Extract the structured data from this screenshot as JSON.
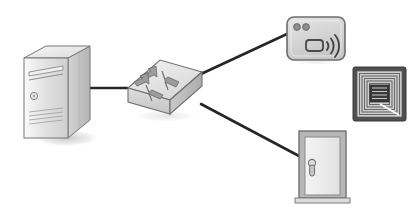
{
  "diagram": {
    "background_color": "#ffffff",
    "style": "grayscale isometric clip-art",
    "line_color": "#262626",
    "nodes": [
      {
        "id": "server",
        "label": "Server",
        "icon": "server-tower-icon",
        "type": "server",
        "x": 22,
        "y": 42,
        "width": 68,
        "height": 100,
        "details": [
          "optical-drive-slot",
          "power-button",
          "front-vents"
        ],
        "colors": {
          "front": "#d8d8d8",
          "side": "#c2c2c2",
          "top": "#ededed",
          "outline": "#7a7a7a"
        }
      },
      {
        "id": "switch",
        "label": "Network Switch",
        "icon": "network-switch-icon",
        "type": "switch",
        "x": 126,
        "y": 60,
        "width": 76,
        "height": 56,
        "details": [
          "four-directional-arrows"
        ],
        "colors": {
          "top": "#e4e4e4",
          "front": "#d0d0d0",
          "side": "#bdbdbd",
          "outline": "#6f6f6f",
          "arrow": "#9a9a9a"
        }
      },
      {
        "id": "card-reader",
        "label": "RFID Card Reader",
        "icon": "rfid-card-reader-icon",
        "type": "reader",
        "x": 286,
        "y": 16,
        "width": 60,
        "height": 46,
        "details": [
          "two-led-indicators",
          "contactless-wave-symbol",
          "card-glyph"
        ],
        "colors": {
          "body": "#d9d9d9",
          "outline": "#6d6d6d",
          "led": "#8d8d8d",
          "wave": "#4a4a4a"
        }
      },
      {
        "id": "rfid-tag",
        "label": "RFID Tag",
        "icon": "rfid-tag-antenna-icon",
        "type": "tag",
        "x": 352,
        "y": 66,
        "width": 54,
        "height": 56,
        "details": [
          "concentric-square-antenna-coil",
          "center-chip-module"
        ],
        "colors": {
          "border": "#4f4f4f",
          "field": "#cfcfcf",
          "trace": "#6b6b6b",
          "chip": "#3a3a3a"
        }
      },
      {
        "id": "door",
        "label": "Door",
        "icon": "door-icon",
        "type": "door",
        "x": 298,
        "y": 130,
        "width": 50,
        "height": 72,
        "details": [
          "door-frame",
          "lever-handle",
          "threshold"
        ],
        "colors": {
          "frame": "#9a9a9a",
          "panel": "#efefef",
          "handle": "#a8a8a8",
          "outline": "#707070"
        }
      }
    ],
    "links": [
      {
        "id": "link-server-switch",
        "label": "Server to switch link",
        "from": "server",
        "to": "switch",
        "x1": 90,
        "y1": 88,
        "x2": 128,
        "y2": 88
      },
      {
        "id": "link-switch-reader",
        "label": "Switch to card reader link",
        "from": "switch",
        "to": "card-reader",
        "x1": 201,
        "y1": 74,
        "x2": 287,
        "y2": 34
      },
      {
        "id": "link-switch-door",
        "label": "Switch to door link",
        "from": "switch",
        "to": "door",
        "x1": 201,
        "y1": 104,
        "x2": 299,
        "y2": 156
      }
    ]
  }
}
